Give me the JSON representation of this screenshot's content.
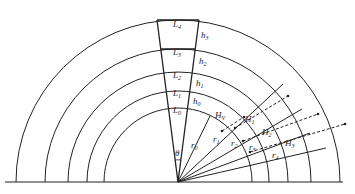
{
  "diagram": {
    "type": "concentric-layer-arcs",
    "center": {
      "x": 178,
      "y": 182
    },
    "baseline": {
      "x1": 5,
      "x2": 343
    },
    "radii": [
      74,
      91,
      110,
      133,
      162
    ],
    "colors": {
      "line": "#222222",
      "background": "#ffffff"
    },
    "layers": [
      {
        "label": "L",
        "sub": "0"
      },
      {
        "label": "L",
        "sub": "1"
      },
      {
        "label": "L",
        "sub": "2"
      },
      {
        "label": "L",
        "sub": "3"
      },
      {
        "label": "L",
        "sub": "4"
      }
    ],
    "thickness_labels": [
      {
        "label": "h",
        "sub": "0"
      },
      {
        "label": "h",
        "sub": "1"
      },
      {
        "label": "h",
        "sub": "2"
      },
      {
        "label": "h",
        "sub": "3"
      }
    ],
    "angle_label": {
      "label": "θ"
    },
    "ray_labels": [
      {
        "label": "r",
        "sub": "0"
      },
      {
        "label": "r",
        "sub": "1"
      },
      {
        "label": "r",
        "sub": "2"
      },
      {
        "label": "r",
        "sub": "3"
      },
      {
        "label": "r",
        "sub": "4"
      }
    ],
    "dimension_labels": [
      {
        "label": "H",
        "sub": "V"
      },
      {
        "label": "H",
        "sub": "1"
      },
      {
        "label": "H",
        "sub": "2"
      },
      {
        "label": "H",
        "sub": "3"
      }
    ]
  }
}
